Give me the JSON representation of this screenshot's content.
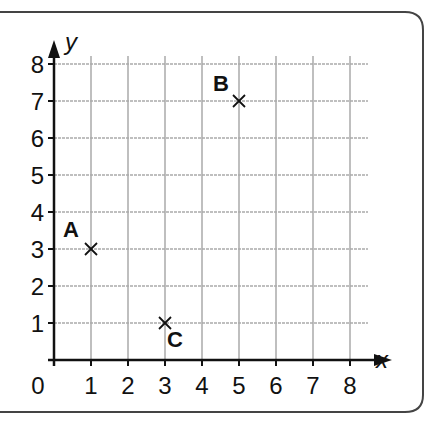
{
  "chart_data": {
    "type": "scatter",
    "title": "",
    "xlabel": "x",
    "ylabel": "y",
    "xlim": [
      0,
      8
    ],
    "ylim": [
      0,
      8
    ],
    "grid": true,
    "x_ticks": [
      "0",
      "1",
      "2",
      "3",
      "4",
      "5",
      "6",
      "7",
      "8"
    ],
    "y_ticks": [
      "1",
      "2",
      "3",
      "4",
      "5",
      "6",
      "7",
      "8"
    ],
    "origin_label": "0",
    "marker": "x",
    "points": [
      {
        "label": "A",
        "x": 1,
        "y": 3
      },
      {
        "label": "B",
        "x": 5,
        "y": 7
      },
      {
        "label": "C",
        "x": 3,
        "y": 1
      }
    ]
  },
  "colors": {
    "axis": "#111111",
    "grid": "#aaaaaa",
    "frame": "#444444",
    "text": "#111111"
  }
}
